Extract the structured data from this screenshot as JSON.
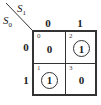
{
  "diagram": {
    "type": "karnaugh-map",
    "column_variable": {
      "name": "S",
      "subscript": "1"
    },
    "row_variable": {
      "name": "S",
      "subscript": "0"
    },
    "column_labels": [
      "0",
      "1"
    ],
    "row_labels": [
      "0",
      "1"
    ],
    "cells": [
      {
        "index": "0",
        "value": "0",
        "circled": false
      },
      {
        "index": "2",
        "value": "1",
        "circled": true
      },
      {
        "index": "1",
        "value": "1",
        "circled": true
      },
      {
        "index": "3",
        "value": "0",
        "circled": false
      }
    ],
    "colors": {
      "line": "#333333",
      "background": "#ffffff"
    }
  }
}
